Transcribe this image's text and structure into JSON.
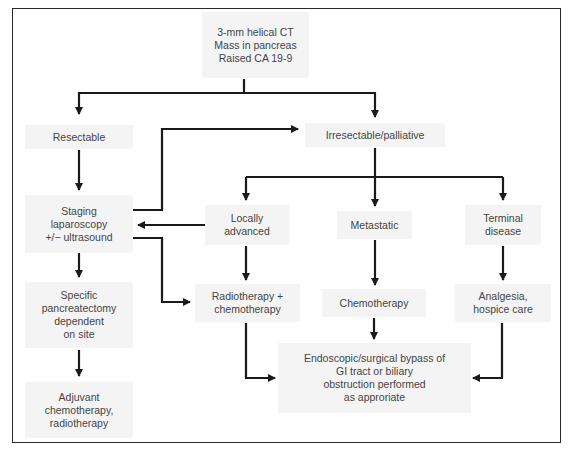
{
  "diagram": {
    "nodes": {
      "start": "3-mm helical CT\nMass in pancreas\nRaised CA 19-9",
      "resectable": "Resectable",
      "irresectable": "Irresectable/palliative",
      "staging": "Staging\nlaparoscopy\n+/− ultrasound",
      "locally_advanced": "Locally\nadvanced",
      "metastatic": "Metastatic",
      "terminal": "Terminal\ndisease",
      "pancreatectomy": "Specific\npancreatectomy\ndependent\non site",
      "radio_chemo": "Radiotherapy +\nchemotherapy",
      "chemotherapy": "Chemotherapy",
      "analgesia": "Analgesia,\nhospice care",
      "adjuvant": "Adjuvant\nchemotherapy,\nradiotherapy",
      "bypass": "Endoscopic/surgical  bypass of\nGI tract or biliary\nobstruction performed\nas approriate"
    },
    "edges": [
      [
        "start",
        "resectable"
      ],
      [
        "start",
        "irresectable"
      ],
      [
        "resectable",
        "staging"
      ],
      [
        "staging",
        "irresectable"
      ],
      [
        "irresectable",
        "locally_advanced"
      ],
      [
        "irresectable",
        "metastatic"
      ],
      [
        "irresectable",
        "terminal"
      ],
      [
        "locally_advanced",
        "staging"
      ],
      [
        "staging",
        "radio_chemo"
      ],
      [
        "staging",
        "pancreatectomy"
      ],
      [
        "locally_advanced",
        "radio_chemo"
      ],
      [
        "metastatic",
        "chemotherapy"
      ],
      [
        "terminal",
        "analgesia"
      ],
      [
        "pancreatectomy",
        "adjuvant"
      ],
      [
        "radio_chemo",
        "bypass"
      ],
      [
        "chemotherapy",
        "bypass"
      ],
      [
        "analgesia",
        "bypass"
      ]
    ],
    "colors": {
      "line": "#1a1a1a",
      "box_fill": "#f4f4f4",
      "text": "#444444"
    }
  }
}
